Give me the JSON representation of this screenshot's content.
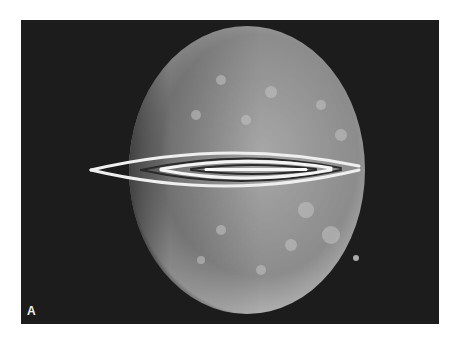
{
  "figure": {
    "panel_label": "A",
    "background_color": "#1c1c1c",
    "sphere_color": "#9a9a9a",
    "fringe_color": "#f0f0f0"
  }
}
